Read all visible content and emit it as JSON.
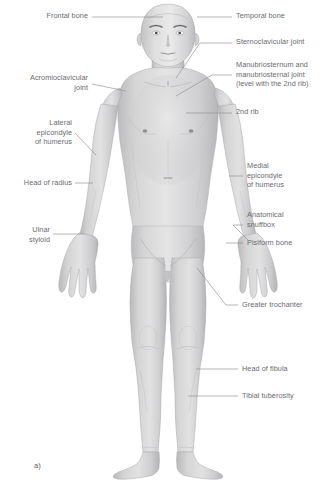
{
  "figure": {
    "caption": "a)",
    "colors": {
      "background": "#ffffff",
      "label_text": "#6b6b6f",
      "leader_line": "#8b8b90",
      "body_fill": "#d2d2d3",
      "body_shade": "#bdbdbf",
      "body_highlight": "#e4e4e5",
      "body_outline": "#a9a9ac"
    },
    "labels_left": [
      {
        "id": "frontal-bone",
        "lines": [
          "Frontal bone"
        ],
        "text": "Frontal bone"
      },
      {
        "id": "acromioclavicular-joint",
        "lines": [
          "Acromioclavicular",
          "joint"
        ],
        "text": "Acromioclavicular\njoint"
      },
      {
        "id": "lateral-epicondyle-of-humerus",
        "lines": [
          "Lateral",
          "epicondyle",
          "of humerus"
        ],
        "text": "Lateral\nepicondyle\nof humerus"
      },
      {
        "id": "head-of-radius",
        "lines": [
          "Head of radius"
        ],
        "text": "Head of radius"
      },
      {
        "id": "ulnar-styloid",
        "lines": [
          "Ulnar",
          "styloid"
        ],
        "text": "Ulnar\nstyloid"
      }
    ],
    "labels_right": [
      {
        "id": "temporal-bone",
        "lines": [
          "Temporal bone"
        ],
        "text": "Temporal bone"
      },
      {
        "id": "sternoclavicular-joint",
        "lines": [
          "Sternoclavicular joint"
        ],
        "text": "Sternoclavicular joint"
      },
      {
        "id": "manubriosternum",
        "lines": [
          "Manubriosternum and",
          "manubriosternal joint",
          "(level with the 2nd rib)"
        ],
        "text": "Manubriosternum and\nmanubriosternal joint\n(level with the 2nd rib)"
      },
      {
        "id": "second-rib",
        "lines": [
          "2nd rib"
        ],
        "text": "2nd rib"
      },
      {
        "id": "medial-epicondyle-of-humerus",
        "lines": [
          "Medial",
          "epicondyle",
          "of humerus"
        ],
        "text": "Medial\nepicondyle\nof humerus"
      },
      {
        "id": "anatomical-snuffbox",
        "lines": [
          "Anatomical",
          "snuffbox"
        ],
        "text": "Anatomical\nsnuffbox"
      },
      {
        "id": "pisiform-bone",
        "lines": [
          "Pisiform bone"
        ],
        "text": "Pisiform bone"
      },
      {
        "id": "greater-trochanter",
        "lines": [
          "Greater trochanter"
        ],
        "text": "Greater trochanter"
      },
      {
        "id": "head-of-fibula",
        "lines": [
          "Head of fibula"
        ],
        "text": "Head of fibula"
      },
      {
        "id": "tibial-tuberosity",
        "lines": [
          "Tibial tuberosity"
        ],
        "text": "Tibial tuberosity"
      }
    ]
  }
}
